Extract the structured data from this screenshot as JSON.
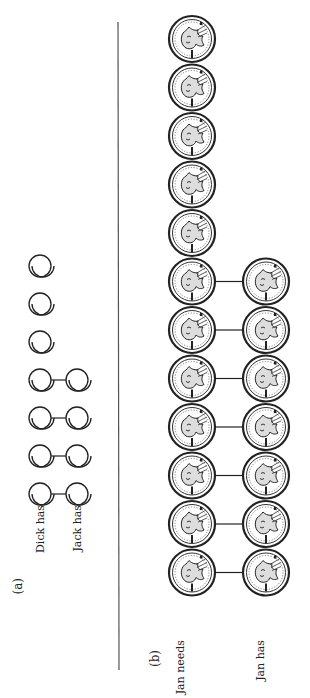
{
  "figure": {
    "divider": {
      "x": 118,
      "y1": 22,
      "y2": 670,
      "color": "#555555"
    },
    "part_a": {
      "label": "(a)",
      "label_pos": {
        "x": 18,
        "y": 578
      },
      "rows": [
        {
          "name": "Dick has",
          "count": 7,
          "x": 40,
          "label_y": 535
        },
        {
          "name": "Jack has",
          "count": 4,
          "x": 77,
          "label_y": 535
        }
      ],
      "circle_radius": 11,
      "y_start": 266,
      "y_step": 38,
      "matched_pairs": 4,
      "description": "Dick has 7 counters, Jack has 4; 4 are matched one-to-one"
    },
    "part_b": {
      "label": "(b)",
      "label_pos": {
        "x": 155,
        "y": 650
      },
      "rows": [
        {
          "name": "Jan needs",
          "count": 12,
          "x": 192,
          "label_y": 600
        },
        {
          "name": "Jan has",
          "count": 7,
          "x": 266,
          "label_y": 600
        }
      ],
      "coin_radius": 23,
      "y_start": 39,
      "y_step": 48.5,
      "matched_pairs": 7,
      "description": "Jan needs 12 pennies, Jan has 7; 7 are matched one-to-one"
    },
    "orientation": "rotated 90 degrees counter-clockwise"
  }
}
